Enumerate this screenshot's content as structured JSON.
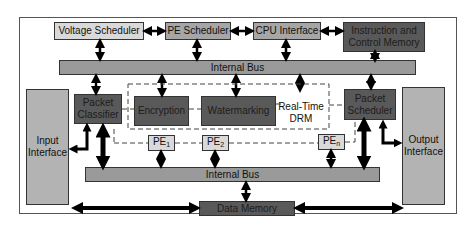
{
  "diagram": {
    "type": "block-diagram",
    "top_row": {
      "voltage_scheduler": "Voltage Scheduler",
      "pe_scheduler": "PE Scheduler",
      "cpu_interface": "CPU Interface",
      "instruction_memory": "Instruction and Control Memory"
    },
    "internal_bus_top": "Internal Bus",
    "internal_bus_bottom": "Internal Bus",
    "packet_classifier": "Packet Classifier",
    "packet_scheduler": "Packet Scheduler",
    "drm_group": {
      "label": "Real-Time DRM",
      "encryption": "Encryption",
      "watermarking": "Watermarking"
    },
    "processing_elements": [
      {
        "base": "PE",
        "sub": "1"
      },
      {
        "base": "PE",
        "sub": "2"
      },
      {
        "base": "PE",
        "sub": "n"
      }
    ],
    "input_interface": "Input Interface",
    "output_interface": "Output Interface",
    "data_memory": "Data Memory"
  }
}
